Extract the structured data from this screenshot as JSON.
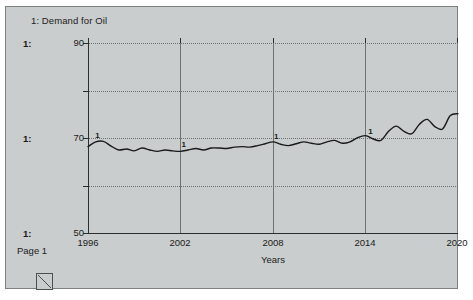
{
  "window": {
    "title": "1: Demand for Oil",
    "page_footer": "Page 1",
    "scale_labels": [
      "1:",
      "1:",
      "1:"
    ],
    "resize_handle_icon": "resize-corner-icon"
  },
  "chart_data": {
    "type": "line",
    "title": "1: Demand for Oil",
    "xlabel": "Years",
    "ylabel": "",
    "xlim": [
      1996,
      2020
    ],
    "ylim": [
      50,
      90
    ],
    "xticks": [
      "1996",
      "2002",
      "2008",
      "2014",
      "2020"
    ],
    "xtick_values": [
      1996,
      2002,
      2008,
      2014,
      2020
    ],
    "yticks": [
      "50",
      "70",
      "90"
    ],
    "ytick_values": [
      50,
      70,
      90
    ],
    "yminor_values": [
      60,
      80
    ],
    "grid": true,
    "legend": "none",
    "series": [
      {
        "name": "1",
        "marker_label": "1",
        "marker_years": [
          1996.6,
          2002.2,
          2008.2,
          2014.3
        ],
        "color": "#1a1a1a",
        "x": [
          1996,
          1996.5,
          1997,
          1997.5,
          1998,
          1998.5,
          1999,
          1999.5,
          2000,
          2000.5,
          2001,
          2001.5,
          2002,
          2002.5,
          2003,
          2003.5,
          2004,
          2004.5,
          2005,
          2005.5,
          2006,
          2006.5,
          2007,
          2007.5,
          2008,
          2008.5,
          2009,
          2009.5,
          2010,
          2010.5,
          2011,
          2011.5,
          2012,
          2012.5,
          2013,
          2013.5,
          2014,
          2014.5,
          2015,
          2015.5,
          2016,
          2016.5,
          2017,
          2017.5,
          2018,
          2018.5,
          2019,
          2019.5,
          2020
        ],
        "y": [
          68.3,
          69.3,
          69.4,
          68.4,
          67.6,
          67.8,
          67.4,
          68.0,
          67.6,
          67.3,
          67.6,
          67.4,
          67.3,
          67.6,
          67.9,
          67.6,
          68.0,
          68.0,
          67.9,
          68.2,
          68.3,
          68.2,
          68.5,
          68.9,
          69.3,
          68.8,
          68.5,
          68.9,
          69.3,
          69.0,
          68.8,
          69.3,
          69.6,
          69.0,
          69.3,
          70.2,
          70.6,
          69.9,
          69.6,
          71.5,
          72.6,
          71.5,
          71.0,
          73.0,
          74.0,
          72.5,
          72.0,
          74.8,
          75.2
        ]
      }
    ]
  }
}
